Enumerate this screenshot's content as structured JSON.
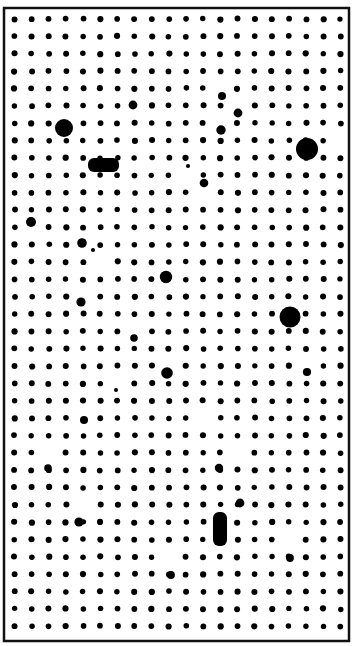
{
  "canvas": {
    "width": 357,
    "height": 646,
    "background_color": "#ffffff",
    "foreground_color": "#000000",
    "title": "Dot Grid Halftone Pattern"
  },
  "border": {
    "name": "image-border",
    "color": "#111111",
    "left": 4,
    "top": 8,
    "right": 349,
    "bottom": 641,
    "stroke_width": 2.5,
    "visible": true
  },
  "grid": {
    "origin_x": 14.5,
    "origin_y": 19.0,
    "step_x": 17.15,
    "step_y": 17.35,
    "columns": 20,
    "rows": 36,
    "base_dot_radius": 2.9,
    "dot_color": "#000000",
    "jitter_amplitude": 0.55,
    "jitter_seed": 20240611
  },
  "anomalies": {
    "description": "Dots whose radius differs from the base grid dot radius.",
    "large_dots": [
      {
        "label": "large-dot-upper-left",
        "col": 3,
        "row": 6,
        "cx": 64,
        "cy": 128,
        "r": 9.0
      },
      {
        "label": "large-dot-upper-right",
        "col": 19,
        "row": 7,
        "cx": 307,
        "cy": 149,
        "r": 11.0
      },
      {
        "label": "large-dot-mid-right",
        "col": 16,
        "row": 17,
        "cx": 290,
        "cy": 317,
        "r": 10.5
      }
    ],
    "medium_dots": [
      {
        "label": "medium-dot-left-row12",
        "col": 1,
        "row": 12,
        "cx": 31,
        "cy": 222,
        "r": 5.0
      },
      {
        "label": "medium-dot-center-a",
        "col": 9,
        "row": 15,
        "cx": 166,
        "cy": 277,
        "r": 6.2
      },
      {
        "label": "medium-dot-center-b",
        "col": 9,
        "row": 20,
        "cx": 167,
        "cy": 373,
        "r": 5.8
      },
      {
        "label": "medium-dot-left-row16",
        "col": 4,
        "row": 16,
        "cx": 81,
        "cy": 302,
        "r": 4.6
      },
      {
        "label": "medium-dot-row13",
        "col": 4,
        "row": 13,
        "cx": 82,
        "cy": 243,
        "r": 4.8
      },
      {
        "label": "medium-dot-col12-row6",
        "col": 12,
        "row": 6,
        "cx": 221,
        "cy": 130,
        "r": 4.7
      },
      {
        "label": "medium-dot-col13-row5",
        "col": 13,
        "row": 5,
        "cx": 238,
        "cy": 113,
        "r": 4.4
      },
      {
        "label": "medium-dot-col11-row10",
        "col": 11,
        "row": 10,
        "cx": 204,
        "cy": 183,
        "r": 4.3
      },
      {
        "label": "medium-dot-col7-row5",
        "col": 7,
        "row": 5,
        "cx": 133,
        "cy": 105,
        "r": 4.4
      },
      {
        "label": "medium-dot-col12-row4",
        "col": 12,
        "row": 4,
        "cx": 222,
        "cy": 96,
        "r": 4.0
      },
      {
        "label": "medium-dot-col11-row23",
        "col": 11,
        "row": 23,
        "cx": 219,
        "cy": 468,
        "r": 4.2
      },
      {
        "label": "medium-dot-col4-row28",
        "col": 4,
        "row": 28,
        "cx": 79,
        "cy": 522,
        "r": 4.6
      },
      {
        "label": "medium-dot-col13-row25",
        "col": 13,
        "row": 25,
        "cx": 240,
        "cy": 503,
        "r": 4.4
      },
      {
        "label": "medium-dot-col17-row20",
        "col": 17,
        "row": 20,
        "cx": 307,
        "cy": 372,
        "r": 4.1
      },
      {
        "label": "medium-dot-col4-row23",
        "col": 4,
        "row": 23,
        "cx": 84,
        "cy": 420,
        "r": 4.0
      },
      {
        "label": "medium-dot-col9-row31",
        "col": 9,
        "row": 31,
        "cx": 171,
        "cy": 575,
        "r": 3.9
      },
      {
        "label": "medium-dot-col16-row30",
        "col": 16,
        "row": 30,
        "cx": 290,
        "cy": 558,
        "r": 3.9
      },
      {
        "label": "medium-dot-col7-row18",
        "col": 7,
        "row": 18,
        "cx": 134,
        "cy": 338,
        "r": 3.8
      },
      {
        "label": "medium-dot-col2-row25",
        "col": 2,
        "row": 25,
        "cx": 48,
        "cy": 468,
        "r": 3.8
      }
    ],
    "small_dots": [
      {
        "label": "small-dot-col5-row14",
        "col": 5,
        "row": 14,
        "cx": 93,
        "cy": 250,
        "r": 2.0
      },
      {
        "label": "small-dot-col10-row9",
        "col": 10,
        "row": 9,
        "cx": 188,
        "cy": 166,
        "r": 2.1
      },
      {
        "label": "small-dot-col6-row21",
        "col": 6,
        "row": 21,
        "cx": 116,
        "cy": 390,
        "r": 2.0
      }
    ],
    "capsules": [
      {
        "label": "horizontal-capsule",
        "orientation": "horizontal",
        "x": 88,
        "y": 158,
        "width": 31,
        "height": 14,
        "radius": 6
      },
      {
        "label": "vertical-capsule",
        "orientation": "vertical",
        "x": 213,
        "y": 512,
        "width": 14,
        "height": 34,
        "radius": 6
      }
    ]
  }
}
